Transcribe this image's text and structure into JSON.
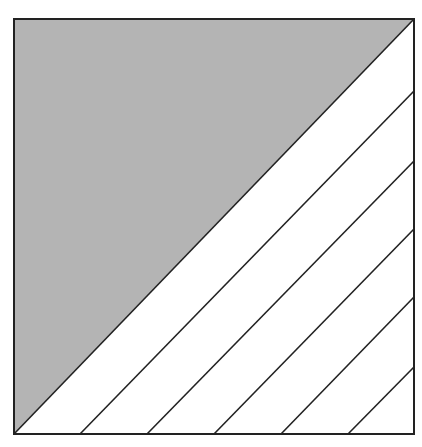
{
  "diagram": {
    "type": "square-with-diagonal-stripes",
    "square": {
      "x": 13,
      "y": 18,
      "size": 401
    },
    "colors": {
      "background": "#ffffff",
      "shaded_region": "#b4b4b4",
      "stroke": "#222222",
      "stripe_region": "#ffffff"
    },
    "shaded_region": "upper-left triangle",
    "diagonal": {
      "from": [
        13,
        434
      ],
      "to": [
        414,
        19
      ]
    },
    "stripe_lines": [
      {
        "from": [
          80,
          434
        ],
        "to": [
          414,
          91
        ]
      },
      {
        "from": [
          147,
          434
        ],
        "to": [
          414,
          161
        ]
      },
      {
        "from": [
          214,
          434
        ],
        "to": [
          414,
          229
        ]
      },
      {
        "from": [
          281,
          434
        ],
        "to": [
          414,
          297
        ]
      },
      {
        "from": [
          348,
          434
        ],
        "to": [
          414,
          367
        ]
      }
    ]
  }
}
